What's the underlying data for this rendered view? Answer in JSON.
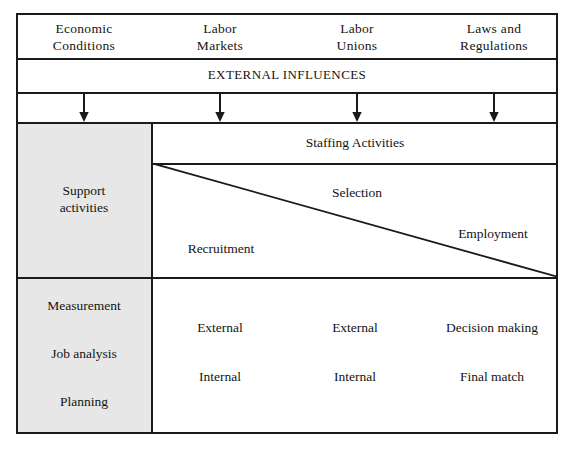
{
  "diagram": {
    "colors": {
      "line": "#1a1a1a",
      "shade": "#e7e7e7",
      "text": "#141414",
      "background": "#ffffff"
    },
    "external_factors": [
      {
        "line1": "Economic",
        "line2": "Conditions"
      },
      {
        "line1": "Labor",
        "line2": "Markets"
      },
      {
        "line1": "Labor",
        "line2": "Unions"
      },
      {
        "line1": "Laws and",
        "line2": "Regulations"
      }
    ],
    "external_band_label": "EXTERNAL INFLUENCES",
    "arrow_icon_name": "down-arrow-icon",
    "support_column": {
      "heading": {
        "line1": "Support",
        "line2": "activities"
      },
      "items": [
        "Measurement",
        "Job analysis",
        "Planning"
      ]
    },
    "staffing": {
      "band_label": "Staffing Activities",
      "phases": [
        "Recruitment",
        "Selection",
        "Employment"
      ]
    },
    "activity_matrix": {
      "rows": [
        [
          "External",
          "External",
          "Decision making"
        ],
        [
          "Internal",
          "Internal",
          "Final match"
        ]
      ]
    }
  }
}
